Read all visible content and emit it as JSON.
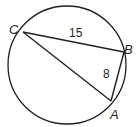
{
  "figure": {
    "type": "inscribed-triangle-in-circle",
    "stroke_color": "#231f20",
    "background": "#ffffff",
    "circle": {
      "cx": 67,
      "cy": 65,
      "r": 59
    },
    "points": {
      "C": {
        "label": "C",
        "x": 23,
        "y": 32
      },
      "B": {
        "label": "B",
        "x": 124,
        "y": 52
      },
      "A": {
        "label": "A",
        "x": 111,
        "y": 101
      }
    },
    "segments": [
      {
        "from": "C",
        "to": "B",
        "length_label": "15"
      },
      {
        "from": "B",
        "to": "A",
        "length_label": "8"
      },
      {
        "from": "C",
        "to": "A",
        "length_label": ""
      }
    ]
  }
}
